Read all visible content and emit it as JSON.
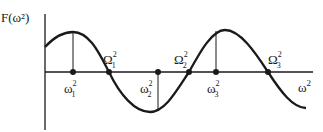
{
  "diagram": {
    "y_axis_label": "F(ω²)",
    "x_axis_label": "ω²",
    "curve": "sinusoidal F(ω²) starting above axis, peak between 0 and Ω₁², crossing down at Ω₁², minimum after ω₂², crossing up at Ω₂², peak at ω₃², crossing down at Ω₃²",
    "maxima_points": [
      {
        "label": "ω",
        "sub": "1",
        "sup": "2"
      },
      {
        "label": "ω",
        "sub": "2",
        "sup": "2"
      },
      {
        "label": "ω",
        "sub": "3",
        "sup": "2"
      }
    ],
    "zero_crossings": [
      {
        "label": "Ω",
        "sub": "1",
        "sup": "2"
      },
      {
        "label": "Ω",
        "sub": "2",
        "sup": "2"
      },
      {
        "label": "Ω",
        "sub": "3",
        "sup": "2"
      }
    ],
    "colors": {
      "line": "#1a1a1a",
      "background": "#ffffff"
    }
  }
}
